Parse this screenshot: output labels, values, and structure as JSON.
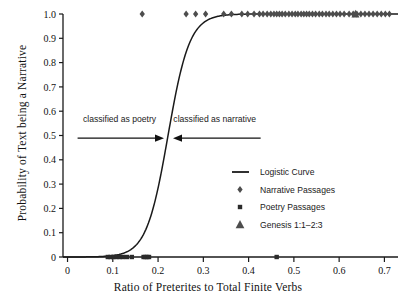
{
  "chart_data": {
    "type": "scatter",
    "title": "",
    "xlabel": "Ratio of Preterites to Total Finite Verbs",
    "ylabel": "Probability of Text being a Narrative",
    "xlim": [
      -0.01,
      0.73
    ],
    "ylim": [
      0,
      1.0
    ],
    "grid": false,
    "legend_position": "center-right",
    "xticks": [
      "0",
      "0.1",
      "0.2",
      "0.3",
      "0.4",
      "0.5",
      "0.6",
      "0.7"
    ],
    "xtick_values": [
      0,
      0.1,
      0.2,
      0.3,
      0.4,
      0.5,
      0.6,
      0.7
    ],
    "yticks": [
      "0",
      "0.1",
      "0.2",
      "0.3",
      "0.4",
      "0.5",
      "0.6",
      "0.7",
      "0.8",
      "0.9",
      "1.0"
    ],
    "ytick_values": [
      0,
      0.1,
      0.2,
      0.3,
      0.4,
      0.5,
      0.6,
      0.7,
      0.8,
      0.9,
      1.0
    ],
    "series": [
      {
        "name": "Logistic Curve",
        "type": "line",
        "marker": "line",
        "color": "#1a1a1a",
        "model": "logistic",
        "midpoint": 0.222,
        "slope": 42.0
      },
      {
        "name": "Narrative Passages",
        "type": "scatter",
        "marker": "diamond",
        "color": "#4d4d4d",
        "y_value": 1.0,
        "x": [
          0.165,
          0.262,
          0.283,
          0.305,
          0.345,
          0.362,
          0.385,
          0.398,
          0.412,
          0.424,
          0.432,
          0.441,
          0.449,
          0.456,
          0.462,
          0.468,
          0.474,
          0.481,
          0.489,
          0.496,
          0.503,
          0.509,
          0.516,
          0.522,
          0.528,
          0.534,
          0.541,
          0.548,
          0.556,
          0.563,
          0.571,
          0.578,
          0.586,
          0.594,
          0.602,
          0.611,
          0.622,
          0.631,
          0.639,
          0.648,
          0.657,
          0.666,
          0.675,
          0.684,
          0.693,
          0.702,
          0.711
        ]
      },
      {
        "name": "Poetry Passages",
        "type": "scatter",
        "marker": "square",
        "color": "#2b2b2b",
        "y_value": 0.0,
        "x": [
          0.089,
          0.095,
          0.101,
          0.108,
          0.115,
          0.122,
          0.131,
          0.142,
          0.168,
          0.172,
          0.176,
          0.18,
          0.462
        ]
      },
      {
        "name": "Genesis 1:1–2:3",
        "type": "scatter",
        "marker": "triangle",
        "color": "#4d4d4d",
        "y_value": 1.0,
        "x": [
          0.636
        ]
      }
    ],
    "annotations": [
      {
        "text": "classified as poetry",
        "x": 0.115,
        "y": 0.555,
        "arrow": "right"
      },
      {
        "text": "classified as narrative",
        "x": 0.325,
        "y": 0.555,
        "arrow": "left"
      }
    ]
  },
  "legend": {
    "items": [
      {
        "label": "Logistic Curve",
        "marker": "line"
      },
      {
        "label": "Narrative Passages",
        "marker": "diamond"
      },
      {
        "label": "Poetry Passages",
        "marker": "square"
      },
      {
        "label": "Genesis 1:1–2:3",
        "marker": "triangle"
      }
    ]
  },
  "axes": {
    "x_title": "Ratio of Preterites to Total Finite Verbs",
    "y_title": "Probability of Text being a Narrative"
  }
}
